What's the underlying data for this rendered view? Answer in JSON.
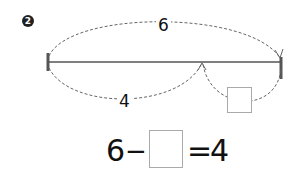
{
  "problem": {
    "number": "2",
    "number_glyph": "❷"
  },
  "diagram": {
    "whole_label": "6",
    "part_label": "4",
    "unknown_part": ""
  },
  "equation": {
    "left": "6",
    "operator": "−",
    "blank": "",
    "equals": "=",
    "right": "4"
  },
  "colors": {
    "line": "#555555",
    "dash": "#666666",
    "box_border": "#aaaaaa",
    "text": "#111111"
  }
}
